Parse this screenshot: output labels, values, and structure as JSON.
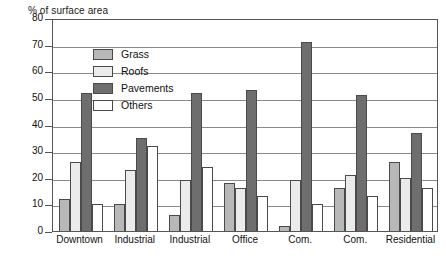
{
  "chart_data": {
    "type": "bar",
    "title": "% of surface area",
    "xlabel": "",
    "ylabel": "% of surface area",
    "ylim": [
      0,
      80
    ],
    "ytick_step": 10,
    "yticks": [
      0,
      10,
      20,
      30,
      40,
      50,
      60,
      70,
      80
    ],
    "grid": true,
    "legend_position": "top-left inside plot",
    "categories": [
      "Downtown",
      "Industrial",
      "Industrial",
      "Office",
      "Com.",
      "Com.",
      "Residential"
    ],
    "series": [
      {
        "name": "Grass",
        "color": "#b8b8b8",
        "values": [
          12,
          10,
          6,
          18,
          2,
          16,
          26
        ]
      },
      {
        "name": "Roofs",
        "color": "#ebebeb",
        "values": [
          26,
          23,
          19,
          16,
          19,
          21,
          20
        ]
      },
      {
        "name": "Pavements",
        "color": "#6e6e6e",
        "values": [
          52,
          35,
          52,
          53,
          71,
          51,
          37
        ]
      },
      {
        "name": "Others",
        "color": "#ffffff",
        "values": [
          10,
          32,
          24,
          13,
          10,
          13,
          16
        ]
      }
    ]
  },
  "legend": {
    "items": [
      {
        "label": "Grass",
        "swatch": "grass"
      },
      {
        "label": "Roofs",
        "swatch": "roofs"
      },
      {
        "label": "Pavements",
        "swatch": "pavements"
      },
      {
        "label": "Others",
        "swatch": "others"
      }
    ]
  },
  "colors": {
    "grass": "#b8b8b8",
    "roofs": "#ebebeb",
    "pavements": "#6e6e6e",
    "others": "#ffffff",
    "axis": "#555555",
    "grid": "#8a8a8a",
    "text": "#111111"
  }
}
